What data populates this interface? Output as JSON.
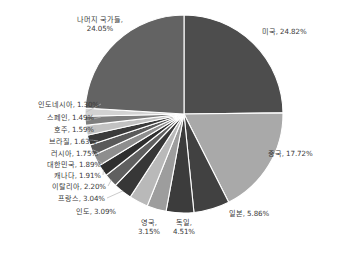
{
  "chart_data": {
    "type": "pie",
    "title": "",
    "subtitle": "",
    "xlabel": "",
    "ylabel": "",
    "unit": "%",
    "legend_position": "none",
    "grid": false,
    "start_angle_deg": 0,
    "direction": "clockwise",
    "categories": [
      "미국",
      "중국",
      "일본",
      "독일",
      "영국",
      "인도",
      "프랑스",
      "이탈리아",
      "캐나다",
      "대한민국",
      "러시아",
      "브라질",
      "호주",
      "스페인",
      "인도네시아",
      "나머지 국가들"
    ],
    "values": [
      24.82,
      17.72,
      5.86,
      4.51,
      3.15,
      3.09,
      3.04,
      2.2,
      1.91,
      1.89,
      1.75,
      1.63,
      1.59,
      1.49,
      1.3,
      24.05
    ],
    "colors": [
      "#4d4d4d",
      "#a9a9a9",
      "#414141",
      "#3c3c3c",
      "#9d9d9d",
      "#b9b9b9",
      "#373737",
      "#606060",
      "#2f2f2f",
      "#8e8e8e",
      "#5a5a5a",
      "#3a3a3a",
      "#c2c2c2",
      "#7d7d7d",
      "#d2d2d2",
      "#636363"
    ],
    "slices": [
      {
        "name": "미국",
        "value": 24.82,
        "label": "미국, 24.82%",
        "color": "#4d4d4d"
      },
      {
        "name": "중국",
        "value": 17.72,
        "label": "중국, 17.72%",
        "color": "#a9a9a9"
      },
      {
        "name": "일본",
        "value": 5.86,
        "label": "일본, 5.86%",
        "color": "#414141"
      },
      {
        "name": "독일",
        "value": 4.51,
        "label": "독일,\n4.51%",
        "color": "#3c3c3c"
      },
      {
        "name": "영국",
        "value": 3.15,
        "label": "영국,\n3.15%",
        "color": "#9d9d9d"
      },
      {
        "name": "인도",
        "value": 3.09,
        "label": "인도, 3.09%",
        "color": "#b9b9b9"
      },
      {
        "name": "프랑스",
        "value": 3.04,
        "label": "프랑스, 3.04%",
        "color": "#373737"
      },
      {
        "name": "이탈리아",
        "value": 2.2,
        "label": "이탈리아, 2.20%",
        "color": "#606060"
      },
      {
        "name": "캐나다",
        "value": 1.91,
        "label": "캐나다, 1.91%",
        "color": "#2f2f2f"
      },
      {
        "name": "대한민국",
        "value": 1.89,
        "label": "대한민국, 1.89%",
        "color": "#8e8e8e"
      },
      {
        "name": "러시아",
        "value": 1.75,
        "label": "러시아, 1.75%",
        "color": "#5a5a5a"
      },
      {
        "name": "브라질",
        "value": 1.63,
        "label": "브라질, 1.63%",
        "color": "#3a3a3a"
      },
      {
        "name": "호주",
        "value": 1.59,
        "label": "호주, 1.59%",
        "color": "#c2c2c2"
      },
      {
        "name": "스페인",
        "value": 1.49,
        "label": "스페인, 1.49%",
        "color": "#7d7d7d"
      },
      {
        "name": "인도네시아",
        "value": 1.3,
        "label": "인도네시아, 1.30%",
        "color": "#d2d2d2"
      },
      {
        "name": "나머지 국가들",
        "value": 24.05,
        "label": "나머지 국가들,\n24.05%",
        "color": "#636363"
      }
    ]
  },
  "labels": {
    "us": "미국, 24.82%",
    "china": "중국, 17.72%",
    "japan": "일본, 5.86%",
    "germany": "독일,\n4.51%",
    "uk": "영국,\n3.15%",
    "india": "인도, 3.09%",
    "france": "프랑스, 3.04%",
    "italy": "이탈리아, 2.20%",
    "canada": "캐나다, 1.91%",
    "korea": "대한민국, 1.89%",
    "russia": "러시아, 1.75%",
    "brazil": "브라질, 1.63%",
    "australia": "호주, 1.59%",
    "spain": "스페인, 1.49%",
    "indonesia": "인도네시아, 1.30%",
    "others": "나머지 국가들,\n24.05%"
  },
  "geometry": {
    "center_x": 184,
    "center_y": 114,
    "radius": 99
  }
}
